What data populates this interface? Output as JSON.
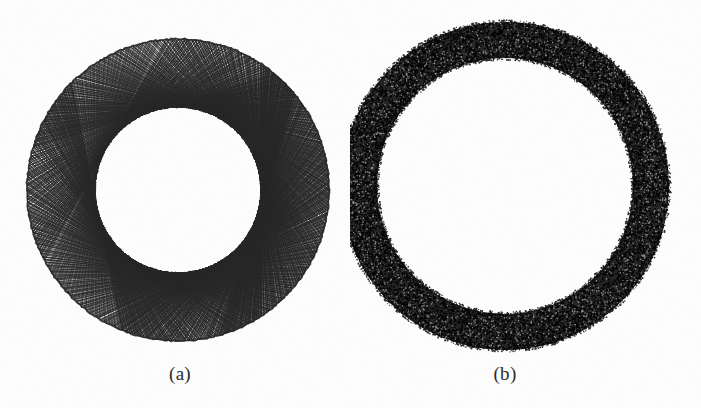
{
  "figure": {
    "width": 701,
    "height": 408,
    "background_color": "#fdfdfd",
    "ink_color": "#111111",
    "panels": [
      {
        "id": "a",
        "caption": "(a)",
        "render_style": "chord-lattice-mesh",
        "center_x": 178,
        "center_y": 190,
        "outer_radius": 151,
        "inner_radius": 83,
        "caption_center_x": 180,
        "caption_baseline_y": 382
      },
      {
        "id": "b",
        "caption": "(b)",
        "render_style": "dense-stipple-dots",
        "center_x": 505,
        "center_y": 186,
        "outer_radius": 164,
        "inner_radius": 128,
        "caption_center_x": 505,
        "caption_baseline_y": 382
      }
    ]
  },
  "chart_data": {
    "type": "scatter",
    "title": "",
    "xlabel": "",
    "ylabel": "",
    "grid": false,
    "legend": "none",
    "subplots": [
      {
        "label": "(a)",
        "description": "Annulus filled by an envelope of straight chords forming a woven lattice / spirograph-like mesh",
        "shape": "annulus",
        "center": [
          178,
          190
        ],
        "outer_radius": 151,
        "inner_radius": 83,
        "radius_ratio": 0.55,
        "band_width": 68,
        "marker": "line-chord",
        "n_chords": 260,
        "chord_step": 0.47,
        "stroke_color": "#141414",
        "stroke_width": 0.9,
        "fill_appearance": "open-mesh",
        "ink_density": 0.45
      },
      {
        "label": "(b)",
        "description": "Annulus uniformly filled with dense random sample points appearing solid black",
        "shape": "annulus",
        "center": [
          505,
          186
        ],
        "outer_radius": 164,
        "inner_radius": 128,
        "radius_ratio": 0.78,
        "band_width": 36,
        "marker": "point",
        "n_points": 9000,
        "point_radius": 0.85,
        "stroke_color": "#0b0b0b",
        "fill_appearance": "solid-stipple",
        "ink_density": 0.93
      }
    ],
    "xlim": [
      0,
      701
    ],
    "ylim": [
      0,
      408
    ]
  }
}
